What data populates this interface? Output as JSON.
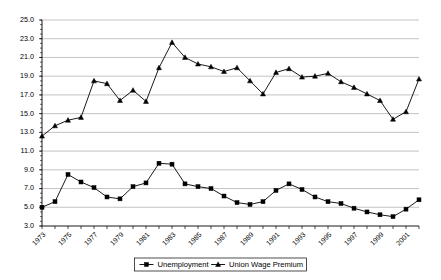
{
  "chart_data": {
    "type": "line",
    "title": "",
    "subtitle": "",
    "xlabel": "",
    "ylabel": "",
    "ylim": [
      3.0,
      25.0
    ],
    "ytick_step": 2.0,
    "yticks": [
      "3.0",
      "5.0",
      "7.0",
      "9.0",
      "11.0",
      "13.0",
      "15.0",
      "17.0",
      "19.0",
      "21.0",
      "23.0",
      "25.0"
    ],
    "grid": true,
    "grid_axis": "y",
    "legend_position": "bottom",
    "x": [
      1973,
      1974,
      1975,
      1976,
      1977,
      1978,
      1979,
      1980,
      1981,
      1982,
      1983,
      1984,
      1985,
      1986,
      1987,
      1988,
      1989,
      1990,
      1991,
      1992,
      1993,
      1994,
      1995,
      1996,
      1997,
      1998,
      1999,
      2000,
      2001,
      2002
    ],
    "xtick_labels_shown": [
      "1973",
      "1975",
      "1977",
      "1979",
      "1981",
      "1983",
      "1985",
      "1987",
      "1989",
      "1991",
      "1993",
      "1995",
      "1997",
      "1999",
      "2001"
    ],
    "series": [
      {
        "name": "Unemployment",
        "marker": "square",
        "values": [
          5.0,
          5.6,
          8.5,
          7.7,
          7.1,
          6.1,
          5.9,
          7.2,
          7.6,
          9.7,
          9.6,
          7.5,
          7.2,
          7.0,
          6.2,
          5.5,
          5.3,
          5.6,
          6.8,
          7.5,
          6.9,
          6.1,
          5.6,
          5.4,
          4.9,
          4.5,
          4.2,
          4.0,
          4.8,
          5.8
        ],
        "color": "#000000"
      },
      {
        "name": "Union Wage Premium",
        "marker": "triangle",
        "values": [
          12.6,
          13.7,
          14.3,
          14.6,
          18.5,
          18.2,
          16.4,
          17.5,
          16.3,
          19.9,
          22.6,
          21.0,
          20.3,
          20.0,
          19.5,
          19.9,
          18.5,
          17.1,
          19.4,
          19.8,
          18.9,
          19.0,
          19.3,
          18.4,
          17.8,
          17.1,
          16.4,
          14.4,
          15.2,
          18.7
        ],
        "color": "#000000"
      }
    ]
  },
  "legend": {
    "items": [
      {
        "label": "Unemployment",
        "marker": "square"
      },
      {
        "label": "Union Wage Premium",
        "marker": "triangle"
      }
    ]
  }
}
